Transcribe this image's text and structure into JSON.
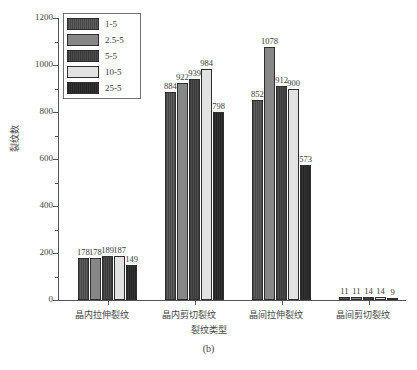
{
  "figure": {
    "caption": "(b)"
  },
  "chart_data": {
    "type": "bar",
    "title": "",
    "subtitle": "",
    "xlabel": "裂纹类型",
    "ylabel": "裂纹数",
    "categories": [
      "晶内拉伸裂纹",
      "晶内剪切裂纹",
      "晶间拉伸裂纹",
      "晶间剪切裂纹"
    ],
    "series": [
      {
        "name": "1-5",
        "color": "#565656",
        "values": [
          178,
          884,
          852,
          11
        ]
      },
      {
        "name": "2.5-5",
        "color": "#878787",
        "values": [
          178,
          922,
          1078,
          11
        ]
      },
      {
        "name": "5-5",
        "color": "#454545",
        "values": [
          189,
          939,
          912,
          14
        ]
      },
      {
        "name": "10-5",
        "color": "#e2e2e2",
        "values": [
          187,
          984,
          900,
          14
        ]
      },
      {
        "name": "25-5",
        "color": "#2b2b2b",
        "values": [
          149,
          798,
          573,
          9
        ]
      }
    ],
    "ylim": [
      0,
      1200
    ],
    "yticks": [
      0,
      200,
      400,
      600,
      800,
      1000,
      1200
    ],
    "ytick_labels": [
      "0",
      "200",
      "400",
      "600",
      "800",
      "1000",
      "1200"
    ],
    "yminor_step": 100,
    "grid": false,
    "legend_position": "upper-left",
    "data_labels": true
  }
}
